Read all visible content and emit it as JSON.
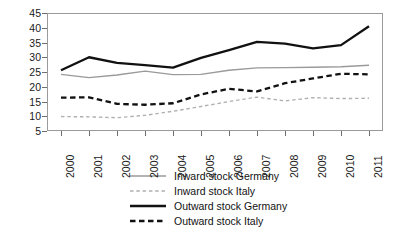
{
  "chart_data": {
    "type": "line",
    "title": "",
    "subtitle": "",
    "xlabel": "",
    "ylabel": "",
    "categories": [
      "2000",
      "2001",
      "2002",
      "2003",
      "2004",
      "2005",
      "2006",
      "2007",
      "2008",
      "2009",
      "2010",
      "2011"
    ],
    "x_tick_labels": [
      "2000",
      "2001",
      "2002",
      "2003",
      "2004",
      "2005",
      "2006",
      "2007",
      "2008",
      "2009",
      "2010",
      "2011"
    ],
    "y_tick_labels": [
      "5",
      "10",
      "15",
      "20",
      "25",
      "30",
      "35",
      "40",
      "45"
    ],
    "y_ticks": [
      5,
      10,
      15,
      20,
      25,
      30,
      35,
      40,
      45
    ],
    "ylim": [
      5,
      45
    ],
    "grid": false,
    "legend_position": "bottom-center",
    "series": [
      {
        "name": "Inward stock Germany",
        "style": "solid",
        "color": "#9a9a9a",
        "width": 1.4,
        "values": [
          24.2,
          23.1,
          24.0,
          25.3,
          24.1,
          24.2,
          25.6,
          26.4,
          26.5,
          26.6,
          26.8,
          27.3
        ]
      },
      {
        "name": "Inward stock Italy",
        "style": "dashed",
        "color": "#b0b0b0",
        "width": 1.4,
        "values": [
          9.9,
          9.8,
          9.5,
          10.3,
          11.7,
          13.3,
          15.0,
          16.5,
          15.2,
          16.3,
          16.0,
          16.1
        ]
      },
      {
        "name": "Outward stock Germany",
        "style": "solid",
        "color": "#111111",
        "width": 2.3,
        "values": [
          25.6,
          30.0,
          28.1,
          27.3,
          26.5,
          29.8,
          32.4,
          35.2,
          34.6,
          33.0,
          34.1,
          40.5
        ]
      },
      {
        "name": "Outward stock Italy",
        "style": "dashed",
        "color": "#111111",
        "width": 2.3,
        "values": [
          16.3,
          16.4,
          14.2,
          13.9,
          14.4,
          17.4,
          19.3,
          18.4,
          21.2,
          22.8,
          24.4,
          24.2
        ]
      }
    ]
  },
  "legend": {
    "items": [
      {
        "label": "Inward stock Germany"
      },
      {
        "label": "Inward stock Italy"
      },
      {
        "label": "Outward stock Germany"
      },
      {
        "label": "Outward stock Italy"
      }
    ]
  },
  "colors": {
    "axis": "#9a9a9a",
    "tick": "#6e6e6e",
    "text": "#111111",
    "background": "#ffffff"
  }
}
